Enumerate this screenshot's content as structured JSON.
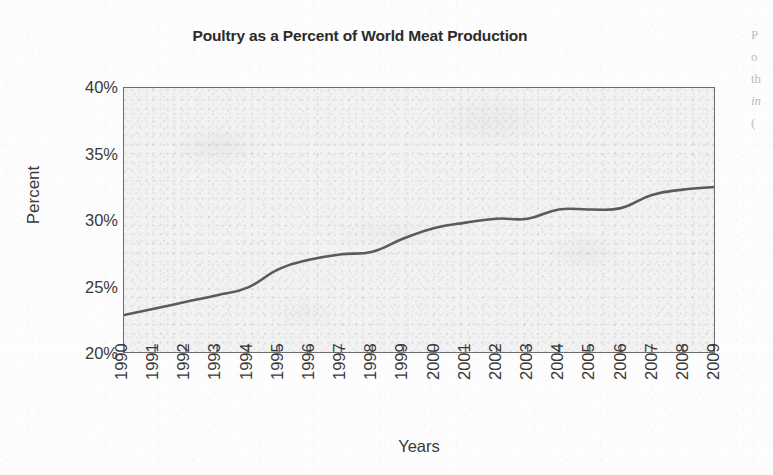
{
  "figure": {
    "title": "Poultry as a Percent of World Meat Production",
    "xlabel": "Years",
    "ylabel": "Percent"
  },
  "margin_bleed": {
    "lines": [
      "P",
      "o",
      "th",
      "in",
      "("
    ]
  },
  "chart_data": {
    "type": "line",
    "title": "Poultry as a Percent of World Meat Production",
    "xlabel": "Years",
    "ylabel": "Percent",
    "xlim": [
      1990,
      2009
    ],
    "ylim": [
      20,
      40
    ],
    "ytick_labels": [
      "20%",
      "25%",
      "30%",
      "35%",
      "40%"
    ],
    "ytick_values": [
      20,
      25,
      30,
      35,
      40
    ],
    "grid": false,
    "legend": null,
    "line_color": "#5b5b5b",
    "plot_background": "#f2f2f2",
    "x": [
      1990,
      1991,
      1992,
      1993,
      1994,
      1995,
      1996,
      1997,
      1998,
      1999,
      2000,
      2001,
      2002,
      2003,
      2004,
      2005,
      2006,
      2007,
      2008,
      2009
    ],
    "xtick_labels": [
      "1990",
      "1991",
      "1992",
      "1993",
      "1994",
      "1995",
      "1996",
      "1997",
      "1998",
      "1999",
      "2000",
      "2001",
      "2002",
      "2003",
      "2004",
      "2005",
      "2006",
      "2007",
      "2008",
      "2009"
    ],
    "series": [
      {
        "name": "Poultry share of world meat production",
        "values": [
          22.8,
          23.3,
          23.8,
          24.3,
          24.9,
          26.3,
          27.0,
          27.4,
          27.6,
          28.6,
          29.4,
          29.8,
          30.1,
          30.1,
          30.8,
          30.8,
          30.9,
          31.9,
          32.3,
          32.5
        ]
      }
    ]
  }
}
